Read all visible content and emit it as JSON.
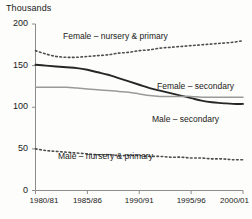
{
  "chart_data": {
    "type": "line",
    "title": "",
    "subtitle": "",
    "xlabel": "",
    "ylabel": "Thousands",
    "ylim": [
      0,
      200
    ],
    "yticks": [
      0,
      50,
      100,
      150,
      200
    ],
    "ytick_labels": [
      "0",
      "50",
      "100",
      "150",
      "200"
    ],
    "x": [
      "1980/81",
      "1981/82",
      "1982/83",
      "1983/84",
      "1984/85",
      "1985/86",
      "1986/87",
      "1987/88",
      "1988/89",
      "1989/90",
      "1990/91",
      "1991/92",
      "1992/93",
      "1993/94",
      "1994/95",
      "1995/96",
      "1996/97",
      "1997/98",
      "1998/99",
      "1999/00",
      "2000/01"
    ],
    "xtick_labels": [
      "1980/81",
      "1985/86",
      "1990/91",
      "1995/96",
      "2000/01"
    ],
    "xtick_indices": [
      0,
      5,
      10,
      15,
      20
    ],
    "grid": false,
    "legend_position": "inline-annotations",
    "series": [
      {
        "name": "Female – nursery & primary",
        "style": "dotted",
        "color": "#4d4d4d",
        "values": [
          168,
          164,
          161,
          160,
          160,
          161,
          162,
          163,
          165,
          166,
          168,
          169,
          171,
          172,
          173,
          174,
          175,
          176,
          177,
          178,
          180
        ]
      },
      {
        "name": "Female – secondary",
        "style": "solid",
        "color": "#262626",
        "values": [
          151,
          150,
          149,
          148,
          147,
          145,
          142,
          139,
          135,
          131,
          127,
          123,
          120,
          117,
          114,
          111,
          108,
          106,
          105,
          104,
          104
        ]
      },
      {
        "name": "Male – secondary",
        "style": "solid",
        "color": "#9a9a9a",
        "values": [
          124,
          124,
          124,
          124,
          123,
          122,
          121,
          120,
          119,
          118,
          116,
          114,
          113,
          113,
          113,
          113,
          112,
          112,
          112,
          112,
          112
        ]
      },
      {
        "name": "Male – nursery & primary",
        "style": "dotted",
        "color": "#4d4d4d",
        "values": [
          50,
          48,
          47,
          46,
          45,
          44,
          43,
          43,
          42,
          42,
          42,
          41,
          41,
          40,
          40,
          39,
          39,
          38,
          38,
          37,
          37
        ]
      }
    ],
    "annotations": [
      {
        "name": "female-nursery-primary-label",
        "text": "Female – nursery & primary",
        "x": 63,
        "y": 31
      },
      {
        "name": "female-secondary-label",
        "text": "Female – secondary",
        "x": 157,
        "y": 81
      },
      {
        "name": "male-secondary-label",
        "text": "Male – secondary",
        "x": 152,
        "y": 114
      },
      {
        "name": "male-nursery-primary-label",
        "text": "Male – nursery & primary",
        "x": 58,
        "y": 151
      }
    ]
  },
  "axes": {
    "unit_label": "Thousands",
    "axis_color": "#8c8c8c"
  }
}
